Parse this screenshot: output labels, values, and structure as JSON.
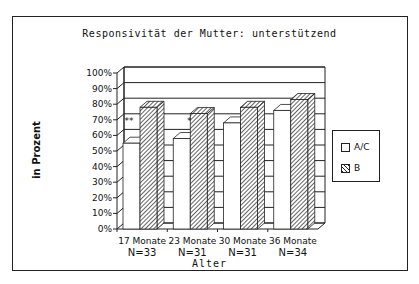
{
  "chart_data": {
    "type": "bar",
    "title": "Responsivität der Mutter: unterstützend",
    "xlabel": "Alter",
    "ylabel": "in Prozent",
    "categories": [
      "17 Monate",
      "23 Monate",
      "30 Monate",
      "36 Monate"
    ],
    "category_n": [
      "N=33",
      "N=31",
      "N=31",
      "N=34"
    ],
    "yticks": [
      "0%",
      "10%",
      "20%",
      "30%",
      "40%",
      "50%",
      "60%",
      "70%",
      "80%",
      "90%",
      "100%"
    ],
    "ylim": [
      0,
      100
    ],
    "series": [
      {
        "name": "A/C",
        "pattern": "white",
        "values": [
          55,
          58,
          68,
          76
        ]
      },
      {
        "name": "B",
        "pattern": "hatched",
        "values": [
          78,
          74,
          78,
          83
        ]
      }
    ],
    "annotations": [
      {
        "category": "17 Monate",
        "text": "**"
      },
      {
        "category": "23 Monate",
        "text": "*"
      }
    ],
    "grid": true,
    "legend_position": "right",
    "style": "3d"
  },
  "legend": {
    "items": [
      {
        "label": "A/C"
      },
      {
        "label": "B"
      }
    ]
  }
}
